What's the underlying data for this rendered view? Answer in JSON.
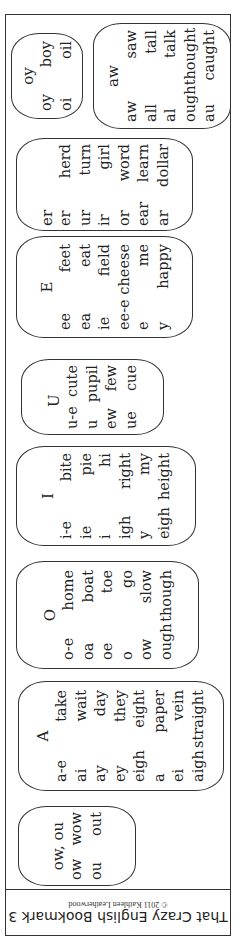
{
  "footer": {
    "title": "That Crazy English Bookmark 3",
    "copyright": "© 2011 Kathleen Leatherwood"
  },
  "cards": [
    {
      "id": "oy",
      "header": "oy",
      "box": {
        "x": 5,
        "y": 18,
        "w": 72,
        "h": 86
      },
      "inner_w": 68,
      "rows": [
        [
          "oy",
          "boy"
        ],
        [
          "oi",
          "oil"
        ]
      ]
    },
    {
      "id": "aw",
      "header": "aw",
      "box": {
        "x": 87,
        "y": 8,
        "w": 138,
        "h": 106
      },
      "inner_w": 90,
      "rows": [
        [
          "aw",
          "saw"
        ],
        [
          "all",
          "tall"
        ],
        [
          "al",
          "talk"
        ],
        [
          "ough",
          "thought"
        ],
        [
          "au",
          "caught"
        ]
      ]
    },
    {
      "id": "er",
      "header": "er",
      "box": {
        "x": 10,
        "y": 123,
        "w": 177,
        "h": 93
      },
      "inner_w": 80,
      "rows": [
        [
          "er",
          "herd"
        ],
        [
          "ur",
          "turn"
        ],
        [
          "ir",
          "girl"
        ],
        [
          "or",
          "word"
        ],
        [
          "ear",
          "learn"
        ],
        [
          "ar",
          "dollar"
        ]
      ]
    },
    {
      "id": "E",
      "header": "E",
      "box": {
        "x": 10,
        "y": 221,
        "w": 177,
        "h": 102
      },
      "inner_w": 84,
      "rows": [
        [
          "ee",
          "feet"
        ],
        [
          "ea",
          "eat"
        ],
        [
          "ie",
          "field"
        ],
        [
          "ee-e",
          "cheese"
        ],
        [
          "e",
          "me"
        ],
        [
          "y",
          "happy"
        ]
      ]
    },
    {
      "id": "U",
      "header": "U",
      "box": {
        "x": 15,
        "y": 344,
        "w": 143,
        "h": 76
      },
      "inner_w": 62,
      "rows": [
        [
          "u-e",
          "cute"
        ],
        [
          "u",
          "pupil"
        ],
        [
          "ew",
          "few"
        ],
        [
          "ue",
          "cue"
        ]
      ]
    },
    {
      "id": "I",
      "header": "I",
      "box": {
        "x": 10,
        "y": 431,
        "w": 180,
        "h": 100
      },
      "inner_w": 84,
      "rows": [
        [
          "i-e",
          "bite"
        ],
        [
          "ie",
          "pie"
        ],
        [
          "i",
          "hi"
        ],
        [
          "igh",
          "right"
        ],
        [
          "y",
          "my"
        ],
        [
          "eigh",
          "height"
        ]
      ]
    },
    {
      "id": "O",
      "header": "O",
      "box": {
        "x": 10,
        "y": 546,
        "w": 183,
        "h": 108
      },
      "inner_w": 86,
      "rows": [
        [
          "o-e",
          "home"
        ],
        [
          "oa",
          "boat"
        ],
        [
          "oe",
          "toe"
        ],
        [
          "o",
          "go"
        ],
        [
          "ow",
          "slow"
        ],
        [
          "ough",
          "though"
        ]
      ]
    },
    {
      "id": "A",
      "header": "A",
      "box": {
        "x": 12,
        "y": 666,
        "w": 206,
        "h": 110
      },
      "inner_w": 92,
      "rows": [
        [
          "a-e",
          "take"
        ],
        [
          "ai",
          "wait"
        ],
        [
          "ay",
          "day"
        ],
        [
          "ey",
          "they"
        ],
        [
          "eigh",
          "eight"
        ],
        [
          "a",
          "paper"
        ],
        [
          "ei",
          "vein"
        ],
        [
          "aigh",
          "straight"
        ]
      ]
    },
    {
      "id": "ow",
      "header": "ow, ou",
      "box": {
        "x": 12,
        "y": 791,
        "w": 118,
        "h": 80
      },
      "inner_w": 66,
      "rows": [
        [
          "ow",
          "wow"
        ],
        [
          "ou",
          "out"
        ]
      ]
    }
  ]
}
